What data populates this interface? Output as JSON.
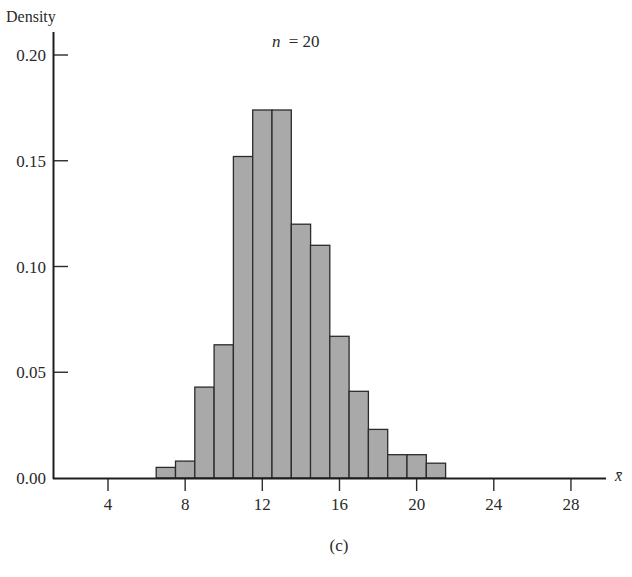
{
  "chart_data": {
    "type": "bar",
    "subtype": "histogram",
    "title": "",
    "annotation": "n = 20",
    "annotation_var": "n",
    "annotation_value": "= 20",
    "caption": "(c)",
    "xlabel": "x̄",
    "ylabel": "Density",
    "xlim": [
      1.5,
      30
    ],
    "ylim": [
      0,
      0.21
    ],
    "grid": false,
    "legend": null,
    "x_ticks": [
      4,
      8,
      12,
      16,
      20,
      24,
      28
    ],
    "x_tick_labels": [
      "4",
      "8",
      "12",
      "16",
      "20",
      "24",
      "28"
    ],
    "y_ticks": [
      0.0,
      0.05,
      0.1,
      0.15,
      0.2
    ],
    "y_tick_labels": [
      "0.00",
      "0.05",
      "0.10",
      "0.15",
      "0.20"
    ],
    "bin_width": 1,
    "bin_edges": [
      6.5,
      7.5,
      8.5,
      9.5,
      10.5,
      11.5,
      12.5,
      13.5,
      14.5,
      15.5,
      16.5,
      17.5,
      18.5,
      19.5,
      20.5,
      21.5
    ],
    "categories": [
      "7",
      "8",
      "9",
      "10",
      "11",
      "12",
      "13",
      "14",
      "15",
      "16",
      "17",
      "18",
      "19",
      "20",
      "21"
    ],
    "values": [
      0.005,
      0.008,
      0.043,
      0.063,
      0.152,
      0.174,
      0.174,
      0.12,
      0.11,
      0.067,
      0.041,
      0.023,
      0.011,
      0.011,
      0.007
    ],
    "colors": {
      "bar_fill": "#a9a9a9",
      "bar_edge": "#2b2b2b",
      "axis": "#1e1e1e"
    }
  }
}
